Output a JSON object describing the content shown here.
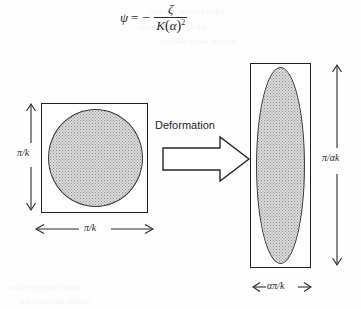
{
  "figure": {
    "equation": {
      "lhs": "ψ",
      "relation": "=",
      "sign": "−",
      "numerator": "ζ",
      "denominator_base": "K",
      "denominator_arg": "α",
      "denominator_exponent": "2",
      "plain_text": "ψ = − ζ / K(α)²"
    },
    "process_label": "Deformation",
    "left_shape": {
      "name": "square-with-inscribed-circle",
      "outer": "square",
      "inner": "circle",
      "height_label": "π/k",
      "width_label": "π/k"
    },
    "right_shape": {
      "name": "rectangle-with-inscribed-ellipse",
      "outer": "rectangle",
      "inner": "ellipse",
      "height_label": "π/αk",
      "width_label": "απ/k"
    },
    "colors": {
      "stroke": "#222222",
      "fill_stipple": "#dcdcdc",
      "background": "#fefefe",
      "text": "#1a1a1a"
    },
    "bleed_text": {
      "line1": "and the second order",
      "line2": "deformation of the",
      "line3": "circular cross section",
      "line4": "under applied strain",
      "line5": "the resulting ellipse"
    }
  }
}
